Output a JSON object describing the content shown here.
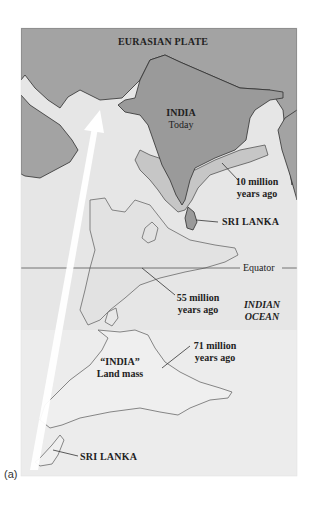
{
  "figure": {
    "panel_label": "(a)",
    "colors": {
      "eurasian_plate": "#a3a3a3",
      "india_today": "#9a9a9a",
      "ten_my": "#c4c4c4",
      "fifty_five_my": "#e2e2e2",
      "seventy_one_my": "#ececec",
      "ocean": "#e6e6e6",
      "coastline": "#2e2e2e",
      "arrow": "#ffffff"
    },
    "labels": {
      "plate": "EURASIAN PLATE",
      "india_today_line1": "INDIA",
      "india_today_line2": "Today",
      "ten_my_line1": "10 million",
      "ten_my_line2": "years ago",
      "sri_lanka_top": "SRI LANKA",
      "equator": "Equator",
      "fifty_five_line1": "55 million",
      "fifty_five_line2": "years ago",
      "ocean_line1": "INDIAN",
      "ocean_line2": "OCEAN",
      "seventy_one_line1": "71 million",
      "seventy_one_line2": "years ago",
      "landmass_line1": "“INDIA”",
      "landmass_line2": "Land mass",
      "sri_lanka_bottom": "SRI LANKA"
    },
    "positions_in_time": [
      {
        "label": "71 million years ago"
      },
      {
        "label": "55 million years ago"
      },
      {
        "label": "10 million years ago"
      },
      {
        "label": "INDIA Today"
      }
    ],
    "motion_arrow": "north-northeast toward Eurasian Plate"
  }
}
